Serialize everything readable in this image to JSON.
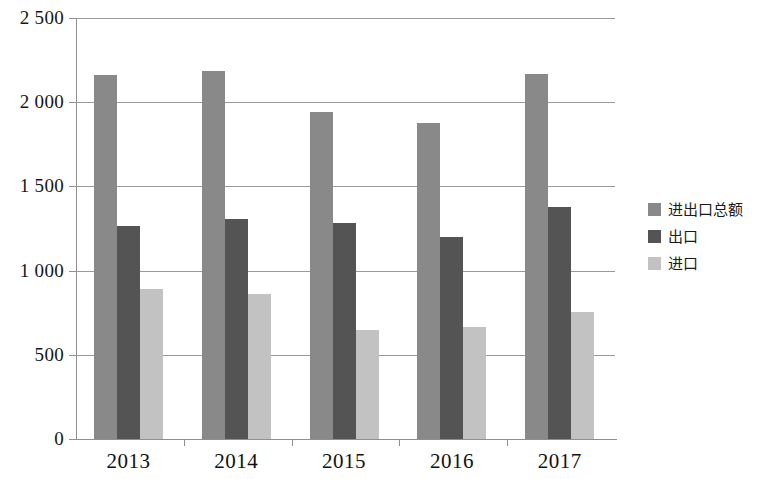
{
  "chart_data": {
    "type": "bar",
    "title": "",
    "subtitle": "",
    "xlabel": "",
    "ylabel": "",
    "categories": [
      "2013",
      "2014",
      "2015",
      "2016",
      "2017"
    ],
    "series": [
      {
        "name": "进出口总额",
        "color": "#898989",
        "values": [
          2160,
          2185,
          1940,
          1875,
          2170
        ]
      },
      {
        "name": "出口",
        "color": "#545454",
        "values": [
          1262,
          1305,
          1285,
          1200,
          1380
        ]
      },
      {
        "name": "进口",
        "color": "#c2c2c2",
        "values": [
          890,
          860,
          650,
          665,
          755
        ]
      }
    ],
    "ylim": [
      0,
      2500
    ],
    "ytick_values": [
      0,
      500,
      1000,
      1500,
      2000,
      2500
    ],
    "ytick_labels": [
      "0",
      "500",
      "1 000",
      "1 500",
      "2 000",
      "2 500"
    ],
    "grid": true,
    "grid_axis": "y",
    "legend_position": "right"
  },
  "legend": {
    "items": [
      {
        "label": "进出口总额",
        "color": "#898989"
      },
      {
        "label": "出口",
        "color": "#545454"
      },
      {
        "label": "进口",
        "color": "#c2c2c2"
      }
    ]
  }
}
